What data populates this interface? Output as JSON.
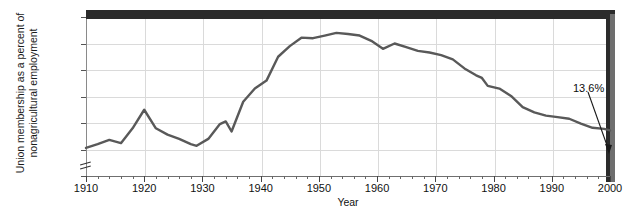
{
  "chart_data": {
    "type": "line",
    "title": "",
    "xlabel": "Year",
    "ylabel_line1": "Union membership as a percent of",
    "ylabel_line2": "nonagricultural employment",
    "xlim": [
      1910,
      2000
    ],
    "ylim": [
      5,
      35
    ],
    "grid": true,
    "legend": "none",
    "y_tick_labels": [
      "35%",
      "30%",
      "25%",
      "20%",
      "15%",
      "10%",
      "5%"
    ],
    "y_tick_values": [
      35,
      30,
      25,
      20,
      15,
      10,
      5
    ],
    "x_tick_labels": [
      "1910",
      "1920",
      "1930",
      "1940",
      "1950",
      "1960",
      "1970",
      "1980",
      "1990",
      "2000"
    ],
    "x_tick_values": [
      1910,
      1920,
      1930,
      1940,
      1950,
      1960,
      1970,
      1980,
      1990,
      2000
    ],
    "x_minor_step": 2,
    "axis_break": true,
    "line_color": "#595959",
    "grid_color": "#dadada",
    "frame_color": "#2b2b2b",
    "annotations": [
      {
        "text": "13.6%",
        "x": 2000,
        "y": 13.6
      }
    ],
    "series": [
      {
        "name": "Union membership as a percent of nonagricultural employment",
        "x": [
          1910,
          1912,
          1914,
          1916,
          1918,
          1920,
          1922,
          1924,
          1926,
          1928,
          1929,
          1931,
          1933,
          1934,
          1935,
          1937,
          1939,
          1941,
          1943,
          1945,
          1947,
          1949,
          1951,
          1953,
          1955,
          1957,
          1959,
          1961,
          1963,
          1965,
          1967,
          1969,
          1971,
          1973,
          1975,
          1977,
          1978,
          1979,
          1981,
          1983,
          1985,
          1987,
          1989,
          1991,
          1993,
          1995,
          1997,
          1999,
          2000
        ],
        "y": [
          10.3,
          11.0,
          11.8,
          11.2,
          14.0,
          17.5,
          14.0,
          12.8,
          12.0,
          11.0,
          10.7,
          12.0,
          14.8,
          15.3,
          13.4,
          19.0,
          21.5,
          23.0,
          27.5,
          29.5,
          31.1,
          31.0,
          31.5,
          32.0,
          31.8,
          31.5,
          30.5,
          29.0,
          30.0,
          29.3,
          28.6,
          28.3,
          27.8,
          27.0,
          25.3,
          24.0,
          23.5,
          22.0,
          21.5,
          20.1,
          18.0,
          17.0,
          16.4,
          16.1,
          15.8,
          14.9,
          14.1,
          13.9,
          13.6
        ]
      }
    ]
  }
}
